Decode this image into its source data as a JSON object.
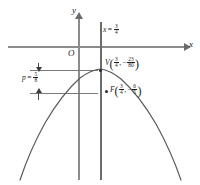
{
  "figure": {
    "type": "parabola-conic-diagram",
    "axes": {
      "x_label": "x",
      "y_label": "y",
      "origin_label": "O"
    },
    "directrix_line": {
      "label_var": "x",
      "equals": "=",
      "value_num": "3",
      "value_den": "4",
      "full_text": "x = 3/4"
    },
    "vertex": {
      "point_label": "V",
      "x_num": "3",
      "x_den": "4",
      "y_sign": "−",
      "y_num": "23",
      "y_den": "80",
      "full_text": "V(3/4, -23/80)"
    },
    "focus": {
      "point_label": "F",
      "x_num": "3",
      "x_den": "4",
      "y_sign": "−",
      "y_num": "6",
      "y_den": "5",
      "full_text": "F(3/4, -6/5)"
    },
    "focal_parameter": {
      "label_var": "p",
      "equals": "=",
      "value_num": "5",
      "value_den": "8",
      "full_text": "p = 5/8"
    },
    "colors": {
      "axis": "#8c8c8c",
      "curve": "#5a5a5a",
      "text": "#1a1a1a",
      "guide": "#7a7a7a",
      "background": "#ffffff"
    }
  }
}
